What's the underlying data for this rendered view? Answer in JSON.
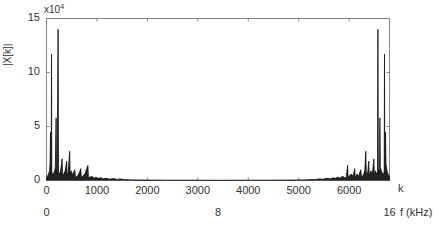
{
  "chart_data": {
    "type": "line",
    "title": "",
    "xlabel": "k",
    "ylabel": "|X[k]|",
    "y_multiplier": "x10^4",
    "xlim": [
      0,
      6800
    ],
    "ylim": [
      0,
      15
    ],
    "x_ticks": [
      0,
      1000,
      2000,
      3000,
      4000,
      5000,
      6000
    ],
    "y_ticks": [
      0,
      5,
      10,
      15
    ],
    "secondary_x_axis": {
      "label": "f (kHz)",
      "ticks": [
        {
          "k": 0,
          "label": "0"
        },
        {
          "k": 3400,
          "label": "8"
        },
        {
          "k": 6800,
          "label": "16"
        }
      ]
    },
    "grid": false,
    "series": [
      {
        "name": "|X[k]|",
        "color": "#111111",
        "points": [
          [
            0,
            0.3
          ],
          [
            20,
            0.4
          ],
          [
            40,
            0.6
          ],
          [
            60,
            0.9
          ],
          [
            70,
            1.5
          ],
          [
            80,
            4.5
          ],
          [
            88,
            0.6
          ],
          [
            94,
            1.2
          ],
          [
            100,
            11.7
          ],
          [
            106,
            0.8
          ],
          [
            120,
            0.5
          ],
          [
            140,
            0.7
          ],
          [
            160,
            0.9
          ],
          [
            175,
            1.2
          ],
          [
            190,
            5.8
          ],
          [
            198,
            0.6
          ],
          [
            210,
            1.0
          ],
          [
            230,
            14.0
          ],
          [
            238,
            0.8
          ],
          [
            260,
            0.6
          ],
          [
            280,
            0.9
          ],
          [
            310,
            2.0
          ],
          [
            318,
            0.5
          ],
          [
            340,
            0.6
          ],
          [
            370,
            0.9
          ],
          [
            400,
            1.8
          ],
          [
            408,
            0.4
          ],
          [
            430,
            0.8
          ],
          [
            460,
            2.7
          ],
          [
            468,
            0.6
          ],
          [
            490,
            0.9
          ],
          [
            520,
            0.5
          ],
          [
            560,
            1.0
          ],
          [
            575,
            0.3
          ],
          [
            610,
            0.4
          ],
          [
            640,
            0.6
          ],
          [
            680,
            1.1
          ],
          [
            690,
            0.3
          ],
          [
            720,
            0.4
          ],
          [
            760,
            0.6
          ],
          [
            820,
            1.4
          ],
          [
            830,
            0.3
          ],
          [
            860,
            0.3
          ],
          [
            900,
            0.4
          ],
          [
            940,
            0.2
          ],
          [
            980,
            0.3
          ],
          [
            1020,
            0.2
          ],
          [
            1080,
            0.25
          ],
          [
            1120,
            0.15
          ],
          [
            1180,
            0.2
          ],
          [
            1250,
            0.12
          ],
          [
            1320,
            0.18
          ],
          [
            1400,
            0.1
          ],
          [
            1460,
            0.15
          ],
          [
            1550,
            0.08
          ],
          [
            1700,
            0.06
          ],
          [
            1900,
            0.05
          ],
          [
            2100,
            0.04
          ],
          [
            2400,
            0.03
          ],
          [
            2700,
            0.03
          ],
          [
            3000,
            0.03
          ],
          [
            3400,
            0.02
          ],
          [
            3800,
            0.03
          ],
          [
            4100,
            0.03
          ],
          [
            4400,
            0.03
          ],
          [
            4700,
            0.04
          ],
          [
            4900,
            0.05
          ],
          [
            5100,
            0.06
          ],
          [
            5250,
            0.08
          ],
          [
            5340,
            0.1
          ],
          [
            5400,
            0.15
          ],
          [
            5480,
            0.12
          ],
          [
            5560,
            0.2
          ],
          [
            5620,
            0.15
          ],
          [
            5680,
            0.25
          ],
          [
            5720,
            0.2
          ],
          [
            5780,
            0.3
          ],
          [
            5820,
            0.2
          ],
          [
            5860,
            0.4
          ],
          [
            5900,
            0.3
          ],
          [
            5940,
            0.2
          ],
          [
            5970,
            1.4
          ],
          [
            5980,
            0.3
          ],
          [
            6040,
            0.6
          ],
          [
            6080,
            0.4
          ],
          [
            6110,
            1.1
          ],
          [
            6120,
            0.3
          ],
          [
            6160,
            0.6
          ],
          [
            6190,
            0.4
          ],
          [
            6230,
            1.0
          ],
          [
            6245,
            0.3
          ],
          [
            6280,
            0.5
          ],
          [
            6310,
            0.9
          ],
          [
            6330,
            2.7
          ],
          [
            6340,
            0.6
          ],
          [
            6370,
            0.8
          ],
          [
            6390,
            1.8
          ],
          [
            6398,
            0.4
          ],
          [
            6430,
            0.9
          ],
          [
            6460,
            0.6
          ],
          [
            6490,
            2.0
          ],
          [
            6498,
            0.5
          ],
          [
            6520,
            0.9
          ],
          [
            6540,
            0.6
          ],
          [
            6562,
            0.8
          ],
          [
            6570,
            14.0
          ],
          [
            6578,
            0.6
          ],
          [
            6590,
            1.0
          ],
          [
            6602,
            0.6
          ],
          [
            6610,
            5.8
          ],
          [
            6618,
            1.2
          ],
          [
            6640,
            0.9
          ],
          [
            6660,
            0.7
          ],
          [
            6680,
            0.5
          ],
          [
            6694,
            0.8
          ],
          [
            6700,
            11.7
          ],
          [
            6706,
            1.2
          ],
          [
            6712,
            0.6
          ],
          [
            6720,
            4.5
          ],
          [
            6730,
            1.5
          ],
          [
            6750,
            0.9
          ],
          [
            6770,
            0.6
          ],
          [
            6790,
            0.4
          ],
          [
            6800,
            0.3
          ]
        ]
      }
    ]
  },
  "labels": {
    "y_axis": "|X[k]|",
    "y_multiplier_base": "x10",
    "y_multiplier_exp": "4",
    "x_axis_k": "k",
    "x_axis_f": "f (kHz)",
    "y_ticks": [
      "0",
      "5",
      "10",
      "15"
    ],
    "x_ticks": [
      "0",
      "1000",
      "2000",
      "3000",
      "4000",
      "5000",
      "6000"
    ],
    "f_ticks": [
      "0",
      "8",
      "16"
    ]
  }
}
